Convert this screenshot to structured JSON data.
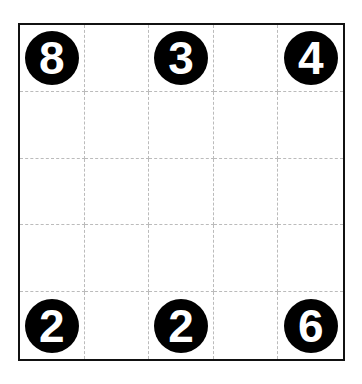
{
  "puzzle": {
    "rows": 5,
    "cols": 5,
    "cells": [
      [
        "8",
        "",
        "3",
        "",
        "4"
      ],
      [
        "",
        "",
        "",
        "",
        ""
      ],
      [
        "",
        "",
        "",
        "",
        ""
      ],
      [
        "",
        "",
        "",
        "",
        ""
      ],
      [
        "2",
        "",
        "2",
        "",
        "6"
      ]
    ]
  }
}
